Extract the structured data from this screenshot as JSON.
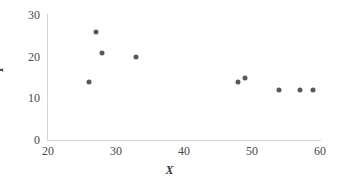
{
  "chart_data": {
    "type": "scatter",
    "title": "",
    "xlabel": "X",
    "ylabel": "Y",
    "xlim": [
      20,
      60
    ],
    "ylim": [
      0,
      30
    ],
    "xticks": [
      20,
      30,
      40,
      50,
      60
    ],
    "yticks": [
      0,
      10,
      20,
      30
    ],
    "grid": false,
    "legend": null,
    "marker_color": "#595959",
    "axis_color": "#d4d4d4",
    "points": [
      {
        "x": 26,
        "y": 14
      },
      {
        "x": 27,
        "y": 26
      },
      {
        "x": 28,
        "y": 21
      },
      {
        "x": 33,
        "y": 20
      },
      {
        "x": 48,
        "y": 14
      },
      {
        "x": 49,
        "y": 15
      },
      {
        "x": 54,
        "y": 12
      },
      {
        "x": 57,
        "y": 12
      },
      {
        "x": 59,
        "y": 12
      }
    ]
  }
}
